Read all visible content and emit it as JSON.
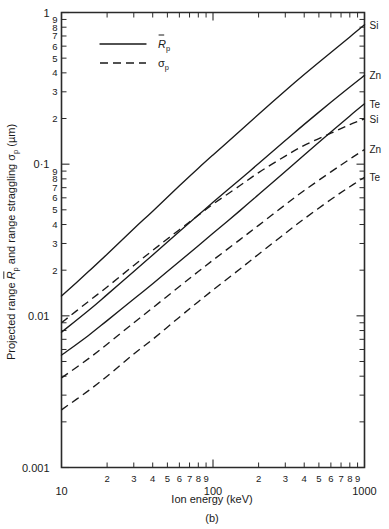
{
  "chart_data": {
    "type": "line",
    "title": "",
    "panel_label": "(b)",
    "xlabel": "Ion energy (keV)",
    "ylabel": "Projected range R̄p and range straggling σp (µm)",
    "ylabel_parts": {
      "prefix": "Projected range ",
      "sym1": "R",
      "sym1_bar": true,
      "sym1_sub": "p",
      "middle": " and range straggling ",
      "sym2": "σ",
      "sym2_sub": "p",
      "suffix": " (µm)"
    },
    "xscale": "log",
    "yscale": "log",
    "xlim": [
      10,
      1000
    ],
    "ylim": [
      0.001,
      1
    ],
    "grid": false,
    "x_major_ticks": [
      10,
      100,
      1000
    ],
    "x_major_labels": [
      "10",
      "100",
      "1000"
    ],
    "x_minor_labels": [
      "2",
      "3",
      "4",
      "5",
      "6",
      "7",
      "8",
      "9"
    ],
    "y_major_ticks": [
      0.001,
      0.01,
      0.1,
      1
    ],
    "y_major_labels": [
      "0.001",
      "0.01",
      "0·1",
      "1"
    ],
    "y_minor_labels": [
      "9",
      "8",
      "7",
      "6",
      "5",
      "4",
      "3",
      "2"
    ],
    "legend": {
      "position": "top-left-inside",
      "entries": [
        {
          "style": "solid",
          "sym": "R",
          "bar": true,
          "sub": "p"
        },
        {
          "style": "dashed",
          "sym": "σ",
          "bar": false,
          "sub": "p"
        }
      ]
    },
    "series": [
      {
        "name": "Si projected range",
        "label": "Si",
        "style": "solid",
        "quantity": "projected_range",
        "x": [
          10,
          15,
          20,
          30,
          40,
          60,
          80,
          100,
          150,
          200,
          300,
          400,
          600,
          800,
          1000
        ],
        "y": [
          0.0135,
          0.0195,
          0.0255,
          0.0375,
          0.049,
          0.072,
          0.094,
          0.115,
          0.165,
          0.213,
          0.305,
          0.39,
          0.545,
          0.69,
          0.83
        ]
      },
      {
        "name": "Zn projected range",
        "label": "Zn",
        "style": "solid",
        "quantity": "projected_range",
        "x": [
          10,
          15,
          20,
          30,
          40,
          60,
          80,
          100,
          150,
          200,
          300,
          400,
          600,
          800,
          1000
        ],
        "y": [
          0.0078,
          0.0108,
          0.0138,
          0.0196,
          0.0252,
          0.036,
          0.0462,
          0.056,
          0.079,
          0.101,
          0.143,
          0.183,
          0.256,
          0.323,
          0.385
        ]
      },
      {
        "name": "Te projected range",
        "label": "Te",
        "style": "solid",
        "quantity": "projected_range",
        "x": [
          10,
          15,
          20,
          30,
          40,
          60,
          80,
          100,
          150,
          200,
          300,
          400,
          600,
          800,
          1000
        ],
        "y": [
          0.0055,
          0.0074,
          0.0093,
          0.0129,
          0.0163,
          0.0228,
          0.029,
          0.035,
          0.0492,
          0.063,
          0.0895,
          0.115,
          0.163,
          0.208,
          0.25
        ]
      },
      {
        "name": "Si range straggling",
        "label": "Si",
        "style": "dashed",
        "quantity": "range_straggling",
        "x": [
          10,
          15,
          20,
          30,
          40,
          60,
          80,
          100,
          150,
          200,
          300,
          400,
          600,
          800,
          1000
        ],
        "y": [
          0.009,
          0.0124,
          0.0155,
          0.0215,
          0.027,
          0.037,
          0.046,
          0.0545,
          0.072,
          0.088,
          0.113,
          0.133,
          0.16,
          0.182,
          0.199
        ]
      },
      {
        "name": "Zn range straggling",
        "label": "Zn",
        "style": "dashed",
        "quantity": "range_straggling",
        "x": [
          10,
          15,
          20,
          30,
          40,
          60,
          80,
          100,
          150,
          200,
          300,
          400,
          600,
          800,
          1000
        ],
        "y": [
          0.0039,
          0.0052,
          0.0065,
          0.009,
          0.0113,
          0.0156,
          0.0196,
          0.0233,
          0.0317,
          0.0395,
          0.054,
          0.067,
          0.089,
          0.108,
          0.125
        ]
      },
      {
        "name": "Te range straggling",
        "label": "Te",
        "style": "dashed",
        "quantity": "range_straggling",
        "x": [
          10,
          15,
          20,
          30,
          40,
          60,
          80,
          100,
          150,
          200,
          300,
          400,
          600,
          800,
          1000
        ],
        "y": [
          0.0024,
          0.0032,
          0.004,
          0.0056,
          0.007,
          0.0098,
          0.0124,
          0.0148,
          0.0203,
          0.0255,
          0.035,
          0.0436,
          0.0585,
          0.071,
          0.082
        ]
      }
    ],
    "colors": {
      "axis": "#2a2a2a",
      "curve": "#1a1a1a",
      "background": "#ffffff"
    }
  }
}
